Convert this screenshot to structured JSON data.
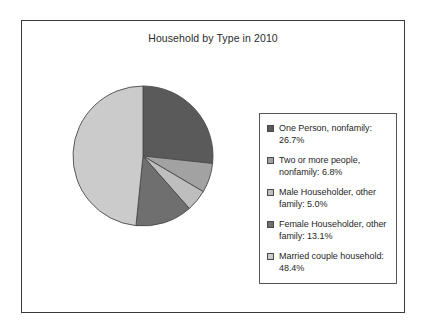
{
  "figure": {
    "title": "Household by Type in 2010",
    "frame_color": "#3a3a3a",
    "background": "#ffffff"
  },
  "legend": {
    "position": "right",
    "border_color": "#555555"
  },
  "chart_data": {
    "type": "pie",
    "title": "Household by Type in 2010",
    "xlabel": "",
    "ylabel": "",
    "start_angle_deg": 90,
    "direction": "clockwise",
    "units": "percent",
    "grid": false,
    "legend_position": "right",
    "categories": [
      "One Person, nonfamily",
      "Two or more people, nonfamily",
      "Male Householder, other family",
      "Female Householder, other family",
      "Married couple household"
    ],
    "values": [
      26.7,
      6.8,
      5.0,
      13.1,
      48.4
    ],
    "colors": [
      "#5a5a5a",
      "#a2a2a2",
      "#bebebe",
      "#6f6f6f",
      "#cbcbcb"
    ],
    "legend_labels": [
      "One Person, nonfamily: 26.7%",
      "Two or more people, nonfamily: 6.8%",
      "Male Householder, other family: 5.0%",
      "Female Householder, other family: 13.1%",
      "Married couple household: 48.4%"
    ],
    "slices": [
      {
        "label": "One Person, nonfamily",
        "value": 26.7,
        "color": "#5a5a5a",
        "legend_label": "One Person, nonfamily: 26.7%"
      },
      {
        "label": "Two or more people, nonfamily",
        "value": 6.8,
        "color": "#a2a2a2",
        "legend_label": "Two or more people, nonfamily: 6.8%"
      },
      {
        "label": "Male Householder, other family",
        "value": 5.0,
        "color": "#bebebe",
        "legend_label": "Male Householder, other family: 5.0%"
      },
      {
        "label": "Female Householder, other family",
        "value": 13.1,
        "color": "#6f6f6f",
        "legend_label": "Female Householder, other family: 13.1%"
      },
      {
        "label": "Married couple household",
        "value": 48.4,
        "color": "#cbcbcb",
        "legend_label": "Married couple household: 48.4%"
      }
    ]
  }
}
